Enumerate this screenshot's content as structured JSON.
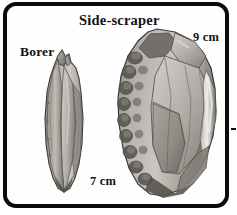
{
  "figure": {
    "kind": "archaeological-illustration",
    "background_color": "#ffffff",
    "frame_color": "#0b0b0b",
    "plate_color": "#fefefe"
  },
  "labels": {
    "title": "Side-scraper",
    "borer": "Borer",
    "scale_scraper": "9 cm",
    "scale_borer": "7 cm"
  },
  "artifacts": [
    {
      "name": "borer",
      "label": "Borer",
      "scale": "7 cm",
      "description": "Elongated pointed flint borer with narrow faceted shaft and sharp beak tip",
      "tones": {
        "highlight": "#d8d6d2",
        "light": "#c3c0bb",
        "mid": "#a3a09a",
        "shadow": "#7d7a75",
        "dark": "#5d5a56",
        "outline": "#3a3835"
      }
    },
    {
      "name": "side-scraper",
      "label": "Side-scraper",
      "scale": "9 cm",
      "description": "Broad teardrop flint side-scraper with scalloped retouch along left edge and large flake scars",
      "tones": {
        "highlight": "#e2e0dc",
        "light": "#c6c3be",
        "mid": "#a6a39d",
        "shadow": "#858279",
        "dark": "#646159",
        "outline": "#3a3835"
      }
    }
  ]
}
